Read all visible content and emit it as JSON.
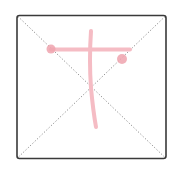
{
  "diagram": {
    "type": "character-stroke-practice-grid",
    "grid": {
      "border_color": "#3a3a3a",
      "guide_color": "#8a8a8a",
      "guide_style": "dotted-diagonals"
    },
    "strokes": {
      "color": "#f5bcc4",
      "dot_color": "#eea3ae",
      "items": [
        {
          "name": "horizontal-stroke",
          "order": 1
        },
        {
          "name": "vertical-curved-stroke",
          "order": 2
        },
        {
          "name": "start-dot-left",
          "order": 1
        },
        {
          "name": "end-dot-right",
          "order": 1
        }
      ]
    }
  }
}
